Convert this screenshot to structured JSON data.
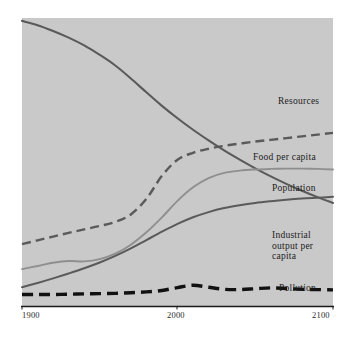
{
  "figure": {
    "background_color": "#ffffff",
    "plot_background_color": "#c9c9c9",
    "axis_color": "#1a1a1a"
  },
  "axis": {
    "ticks": [
      {
        "name": "tick-1900",
        "label": "1900"
      },
      {
        "name": "tick-2000",
        "label": "2000"
      },
      {
        "name": "tick-2100",
        "label": "2100"
      }
    ],
    "x_range": [
      1900,
      2100
    ]
  },
  "series_labels": {
    "resources": "Resources",
    "food_per_capita": "Food per capita",
    "population": "Population",
    "industrial_output_per_capita": "Industrial\noutput per\ncapita",
    "industrial_output_line1": "Industrial",
    "industrial_output_line2": "output per",
    "industrial_output_line3": "capita",
    "pollution": "Pollution"
  },
  "chart_data": {
    "type": "line",
    "title": "",
    "subtitle": "",
    "xlabel": "",
    "ylabel": "",
    "grid": false,
    "legend_position": "inline-right",
    "xlim": [
      1900,
      2100
    ],
    "ylim": [
      0,
      1
    ],
    "xticks": [
      1900,
      2000,
      2100
    ],
    "x": [
      1900,
      1910,
      1920,
      1930,
      1940,
      1950,
      1960,
      1970,
      1980,
      1990,
      2000,
      2010,
      2020,
      2030,
      2040,
      2050,
      2060,
      2070,
      2080,
      2090,
      2100
    ],
    "series": [
      {
        "name": "Resources",
        "color": "#5a5a5a",
        "style": "solid",
        "width": 2.1,
        "values": [
          0.99,
          0.975,
          0.955,
          0.932,
          0.905,
          0.872,
          0.835,
          0.79,
          0.742,
          0.695,
          0.652,
          0.612,
          0.575,
          0.54,
          0.508,
          0.478,
          0.45,
          0.424,
          0.4,
          0.378,
          0.358
        ]
      },
      {
        "name": "Food per capita",
        "color": "#5a5a5a",
        "style": "dashed",
        "width": 2.4,
        "values": [
          0.215,
          0.228,
          0.241,
          0.254,
          0.266,
          0.278,
          0.292,
          0.318,
          0.372,
          0.452,
          0.508,
          0.532,
          0.546,
          0.556,
          0.564,
          0.571,
          0.577,
          0.583,
          0.589,
          0.595,
          0.601
        ]
      },
      {
        "name": "Population",
        "color": "#8f8f8f",
        "style": "solid",
        "width": 1.9,
        "values": [
          0.128,
          0.139,
          0.15,
          0.156,
          0.155,
          0.163,
          0.182,
          0.213,
          0.256,
          0.308,
          0.365,
          0.412,
          0.444,
          0.462,
          0.47,
          0.474,
          0.476,
          0.477,
          0.477,
          0.476,
          0.474
        ]
      },
      {
        "name": "Industrial output per capita",
        "color": "#5a5a5a",
        "style": "solid",
        "width": 2.0,
        "values": [
          0.065,
          0.08,
          0.096,
          0.113,
          0.131,
          0.151,
          0.174,
          0.2,
          0.229,
          0.258,
          0.285,
          0.308,
          0.326,
          0.34,
          0.35,
          0.358,
          0.364,
          0.369,
          0.373,
          0.376,
          0.379
        ]
      },
      {
        "name": "Pollution",
        "color": "#111111",
        "style": "dashed-heavy",
        "width": 3.4,
        "values": [
          0.04,
          0.04,
          0.04,
          0.041,
          0.042,
          0.043,
          0.044,
          0.046,
          0.049,
          0.054,
          0.064,
          0.072,
          0.065,
          0.058,
          0.057,
          0.06,
          0.063,
          0.061,
          0.058,
          0.057,
          0.056
        ]
      }
    ]
  }
}
